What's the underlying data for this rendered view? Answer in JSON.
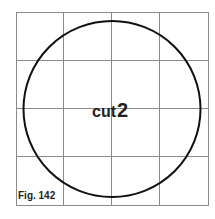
{
  "figure": {
    "caption": "Fig. 142",
    "center_label": {
      "word": "cut",
      "number": "2"
    },
    "grid": {
      "rows": 4,
      "cols": 4
    },
    "colors": {
      "grid": "#8a8a8a",
      "circle": "#111111",
      "text": "#222222"
    }
  }
}
